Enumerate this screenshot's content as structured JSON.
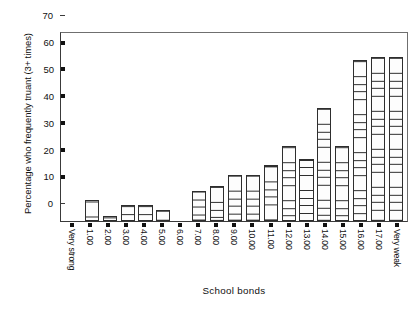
{
  "chart_data": {
    "type": "bar",
    "title": "",
    "xlabel": "School bonds",
    "ylabel": "Percentage who frequently truant (3+ times)",
    "ylim": [
      0,
      70
    ],
    "yticks": [
      0,
      10,
      20,
      30,
      40,
      50,
      60,
      70
    ],
    "ytick_labels": [
      "0",
      "10",
      "20",
      "30",
      "40",
      "50",
      "60",
      "70"
    ],
    "grid": false,
    "legend": false,
    "categories": [
      "Very strong",
      "1.00",
      "2.00",
      "3.00",
      "4.00",
      "5.00",
      "6.00",
      "7.00",
      "8.00",
      "9.00",
      "10.00",
      "11.00",
      "12.00",
      "13.00",
      "14.00",
      "15.00",
      "16.00",
      "17.00",
      "Very weak"
    ],
    "values": [
      0,
      8,
      2,
      6,
      6,
      4,
      0,
      11,
      13,
      17,
      17,
      21,
      28,
      23,
      42,
      28,
      60,
      61,
      61
    ],
    "bar_style": {
      "fill": "#ffffff",
      "edge": "#2e2e2e",
      "hatch": "horizontal-lines"
    }
  }
}
